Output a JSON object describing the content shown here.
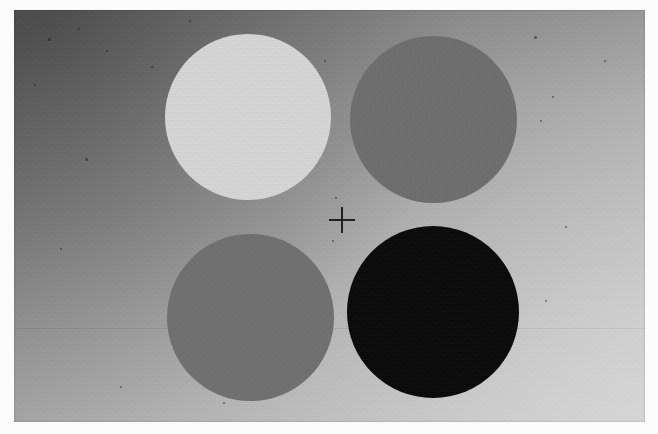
{
  "plate": {
    "title": "Four-Disc Simultaneous-Contrast Plate",
    "medium": "black-and-white photographic print",
    "layout": "2 x 2 disc array around a central fixation cross",
    "background_label": "graded gray field",
    "paper_color": "#fbfbfb",
    "background_dark": "#6f6f6f",
    "background_light": "#c8c8c8"
  },
  "photo": {
    "left": 14,
    "top": 10,
    "width": 631,
    "height": 412
  },
  "fixation": {
    "name": "fixation-cross",
    "glyph": "+",
    "center_x": 342,
    "center_y": 220,
    "size": 26,
    "stroke": 2,
    "color": "#1d1d1d"
  },
  "discs": [
    {
      "id": "disc-top-left",
      "label": "Upper-left disc",
      "tone": "light",
      "color": "#d9d9d9",
      "left": 165,
      "top": 34,
      "diameter": 166,
      "quadrant": "upper-left"
    },
    {
      "id": "disc-top-right",
      "label": "Upper-right disc",
      "tone": "mid-gray",
      "color": "#6d6d6d",
      "left": 350,
      "top": 36,
      "diameter": 167,
      "quadrant": "upper-right"
    },
    {
      "id": "disc-bottom-left",
      "label": "Lower-left disc",
      "tone": "mid-gray",
      "color": "#6f6f6f",
      "left": 167,
      "top": 234,
      "diameter": 167,
      "quadrant": "lower-left"
    },
    {
      "id": "disc-bottom-right",
      "label": "Lower-right disc",
      "tone": "black",
      "color": "#070707",
      "left": 347,
      "top": 226,
      "diameter": 172,
      "quadrant": "lower-right"
    }
  ],
  "specks": [
    {
      "left": 48,
      "top": 38,
      "size": 3
    },
    {
      "left": 78,
      "top": 28,
      "size": 2
    },
    {
      "left": 106,
      "top": 50,
      "size": 2
    },
    {
      "left": 34,
      "top": 84,
      "size": 2
    },
    {
      "left": 85,
      "top": 158,
      "size": 3
    },
    {
      "left": 60,
      "top": 248,
      "size": 2
    },
    {
      "left": 151,
      "top": 66,
      "size": 2
    },
    {
      "left": 189,
      "top": 20,
      "size": 2
    },
    {
      "left": 324,
      "top": 60,
      "size": 2
    },
    {
      "left": 335,
      "top": 197,
      "size": 2
    },
    {
      "left": 534,
      "top": 36,
      "size": 3
    },
    {
      "left": 552,
      "top": 96,
      "size": 2
    },
    {
      "left": 540,
      "top": 120,
      "size": 2
    },
    {
      "left": 565,
      "top": 226,
      "size": 2
    },
    {
      "left": 545,
      "top": 300,
      "size": 2
    },
    {
      "left": 332,
      "top": 240,
      "size": 2
    },
    {
      "left": 120,
      "top": 386,
      "size": 2
    },
    {
      "left": 223,
      "top": 402,
      "size": 2
    },
    {
      "left": 604,
      "top": 60,
      "size": 2
    }
  ]
}
